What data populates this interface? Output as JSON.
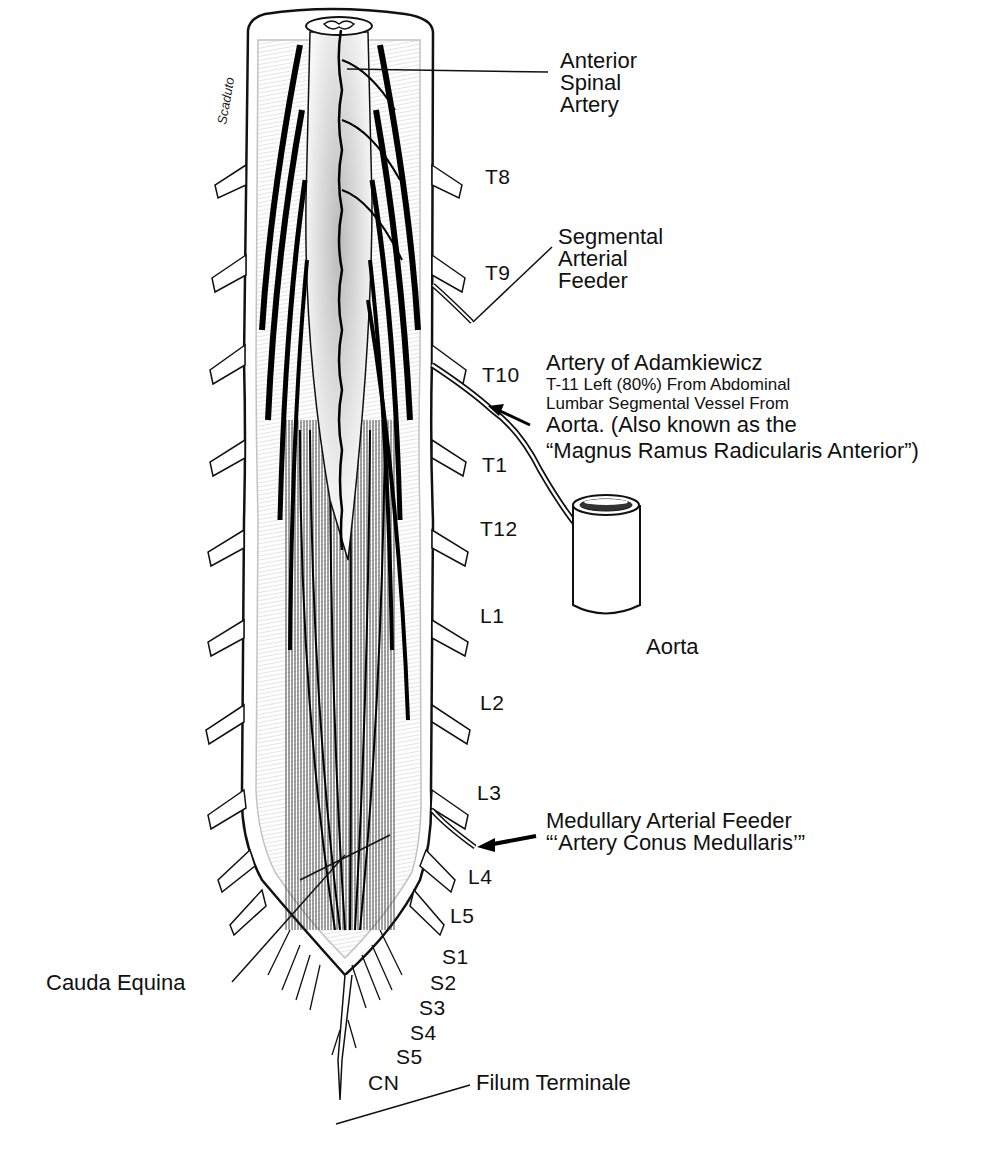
{
  "diagram": {
    "type": "anatomical-illustration",
    "signature": "Scaduto",
    "labels": {
      "anterior_spinal_artery": [
        "Anterior",
        "Spinal",
        "Artery"
      ],
      "segmental_arterial_feeder": [
        "Segmental",
        "Arterial",
        "Feeder"
      ],
      "artery_of_adamkiewicz": {
        "title": "Artery of Adamkiewicz",
        "line1": "T-11 Left (80%) From Abdominal",
        "line2": "Lumbar Segmental Vessel From",
        "line3": "Aorta. (Also known as the",
        "line4": "“Magnus Ramus Radicularis Anterior”)"
      },
      "aorta": "Aorta",
      "medullary_arterial_feeder": {
        "line1": "Medullary Arterial Feeder",
        "line2": "“‘Artery Conus Medullaris’”"
      },
      "cauda_equina": "Cauda Equina",
      "filum_terminale": "Filum Terminale"
    },
    "levels": [
      "T8",
      "T9",
      "T10",
      "T1",
      "T12",
      "L1",
      "L2",
      "L3",
      "L4",
      "L5",
      "S1",
      "S2",
      "S3",
      "S4",
      "S5",
      "CN"
    ]
  }
}
